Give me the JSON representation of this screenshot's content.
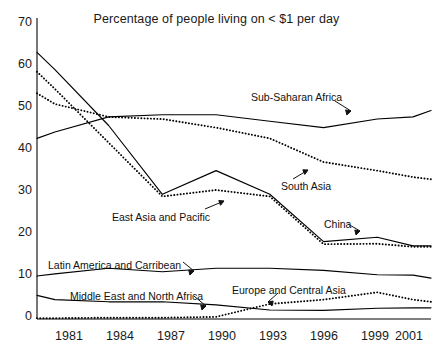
{
  "figure": {
    "title": "Percentage of people living on < $1 per day",
    "caption": ""
  },
  "axes": {
    "yticks": [
      "0",
      "10",
      "20",
      "30",
      "40",
      "50",
      "60",
      "70"
    ],
    "xticks": [
      "1981",
      "1984",
      "1987",
      "1990",
      "1993",
      "1996",
      "1999",
      "2001"
    ]
  },
  "annotations": [
    {
      "name": "sub-saharan-africa",
      "text": "Sub-Saharan Africa"
    },
    {
      "name": "south-asia",
      "text": "South Asia"
    },
    {
      "name": "east-asia-and-pacific",
      "text": "East Asia and Pacific"
    },
    {
      "name": "china",
      "text": "China"
    },
    {
      "name": "latin-america-and-carribean",
      "text": "Latin America and Carribean"
    },
    {
      "name": "middle-east-and-north-africa",
      "text": "Middle  East and North Africa"
    },
    {
      "name": "europe-and-central-asia",
      "text": "Europe and Central Asia"
    }
  ],
  "chart_data": {
    "type": "line",
    "title": "Percentage of people living on < $1 per day",
    "xlabel": "",
    "ylabel": "",
    "xlim": [
      1980,
      2002
    ],
    "ylim": [
      0,
      70
    ],
    "yticks": [
      0,
      10,
      20,
      30,
      40,
      50,
      60,
      70
    ],
    "xticks": [
      1981,
      1984,
      1987,
      1990,
      1993,
      1996,
      1999,
      2001
    ],
    "grid": false,
    "legend": "inline-labels-with-arrows",
    "x": [
      1980,
      1981,
      1984,
      1987,
      1990,
      1993,
      1996,
      1999,
      2001,
      2002
    ],
    "series": [
      {
        "name": "East Asia and Pacific",
        "style": "solid",
        "values": [
          62.0,
          58.0,
          45.0,
          29.0,
          34.5,
          29.0,
          18.0,
          19.0,
          17.0,
          17.0
        ]
      },
      {
        "name": "China",
        "style": "dotted",
        "values": [
          57.5,
          53.5,
          41.0,
          28.5,
          30.0,
          28.5,
          17.4,
          17.5,
          16.8,
          16.8
        ]
      },
      {
        "name": "South Asia",
        "style": "dotted",
        "values": [
          52.5,
          50.0,
          47.0,
          46.5,
          44.5,
          42.0,
          36.5,
          34.5,
          33.0,
          32.5
        ]
      },
      {
        "name": "Sub-Saharan Africa",
        "style": "solid",
        "values": [
          42.0,
          43.5,
          47.0,
          47.5,
          47.5,
          46.0,
          44.5,
          46.5,
          47.0,
          48.5
        ]
      },
      {
        "name": "Latin America and Carribean",
        "style": "solid",
        "values": [
          10.0,
          10.5,
          11.8,
          11.0,
          11.8,
          11.8,
          11.3,
          10.3,
          10.2,
          9.5
        ]
      },
      {
        "name": "Middle East and North Africa",
        "style": "solid",
        "values": [
          5.5,
          4.5,
          4.0,
          4.0,
          3.3,
          2.1,
          2.0,
          2.5,
          2.6,
          2.6
        ]
      },
      {
        "name": "Europe and Central Asia",
        "style": "dotted",
        "values": [
          0.2,
          0.2,
          0.3,
          0.3,
          0.5,
          3.5,
          4.5,
          6.2,
          4.5,
          4.0
        ]
      }
    ]
  }
}
